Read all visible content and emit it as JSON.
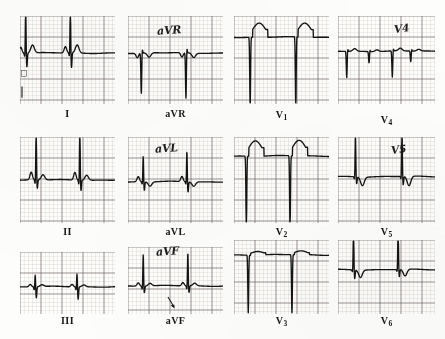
{
  "document": {
    "kind": "12-lead electrocardiogram strip montage",
    "background_color": "#fdfdfb",
    "grid_fine_color": "#b9b0ae",
    "grid_major_color": "#6d6361",
    "trace_color": "#141414",
    "caption_color": "#151515"
  },
  "layout": {
    "columns": 4,
    "rows": 3,
    "panel_width": 98,
    "panel_height": 88
  },
  "panels": [
    {
      "id": "lead-i",
      "caption": "I",
      "subscript": "",
      "handwritten_label": "",
      "x": 20,
      "y": 16,
      "w": 95,
      "h": 88,
      "baseline_frac": 0.42,
      "grid_minor_px": 4.2,
      "annotation_arrow": false,
      "beats": [
        {
          "t": 0.06,
          "type": "qRs",
          "q": 0.04,
          "r": 0.52,
          "s": 0.16,
          "p": 0.07,
          "tw": 0.09,
          "tneg": false
        },
        {
          "t": 0.53,
          "type": "qRs",
          "q": 0.04,
          "r": 0.55,
          "s": 0.17,
          "p": 0.07,
          "tw": 0.09,
          "tneg": false
        }
      ],
      "calibration_mark": true
    },
    {
      "id": "lead-avr",
      "caption": "aVR",
      "subscript": "",
      "handwritten_label": "aVR",
      "x": 128,
      "y": 16,
      "w": 95,
      "h": 88,
      "baseline_frac": 0.42,
      "grid_minor_px": 4.2,
      "annotation_arrow": false,
      "beats": [
        {
          "t": 0.15,
          "type": "QS",
          "q": 0.46,
          "r": 0.05,
          "s": 0.0,
          "p": -0.05,
          "tw": 0.05,
          "tneg": true
        },
        {
          "t": 0.62,
          "type": "QS",
          "q": 0.52,
          "r": 0.06,
          "s": 0.0,
          "p": -0.05,
          "tw": 0.05,
          "tneg": true
        }
      ],
      "calibration_mark": false
    },
    {
      "id": "lead-v1",
      "caption": "V",
      "subscript": "1",
      "handwritten_label": "",
      "x": 234,
      "y": 16,
      "w": 95,
      "h": 88,
      "baseline_frac": 0.24,
      "grid_minor_px": 4.2,
      "annotation_arrow": false,
      "beats": [
        {
          "t": 0.18,
          "type": "QS-deep-ST",
          "q": 0.8,
          "r": 0.0,
          "s": 0.0,
          "st_elev": 0.16,
          "tw": 0.0,
          "tneg": false
        },
        {
          "t": 0.66,
          "type": "QS-deep-ST",
          "q": 0.8,
          "r": 0.0,
          "s": 0.0,
          "st_elev": 0.16,
          "tw": 0.0,
          "tneg": false
        }
      ],
      "calibration_mark": false
    },
    {
      "id": "lead-v4",
      "caption": "V",
      "subscript": "4",
      "handwritten_label": "V4",
      "x": 338,
      "y": 16,
      "w": 97,
      "h": 88,
      "baseline_frac": 0.4,
      "grid_minor_px": 4.2,
      "annotation_arrow": false,
      "beats": [
        {
          "t": 0.1,
          "type": "QS-small",
          "q": 0.3,
          "r": 0.03,
          "s": 0.0,
          "tw": 0.03,
          "tneg": false
        },
        {
          "t": 0.33,
          "type": "q-notch",
          "q": 0.13,
          "r": 0.02,
          "s": 0.0,
          "tw": 0.02,
          "tneg": false
        },
        {
          "t": 0.57,
          "type": "QS-small",
          "q": 0.3,
          "r": 0.03,
          "s": 0.0,
          "tw": 0.03,
          "tneg": false
        },
        {
          "t": 0.76,
          "type": "q-notch",
          "q": 0.12,
          "r": 0.02,
          "s": 0.0,
          "tw": 0.02,
          "tneg": false
        }
      ],
      "calibration_mark": false
    },
    {
      "id": "lead-ii",
      "caption": "II",
      "subscript": "",
      "handwritten_label": "",
      "x": 20,
      "y": 137,
      "w": 95,
      "h": 86,
      "baseline_frac": 0.5,
      "grid_minor_px": 4.2,
      "annotation_arrow": false,
      "beats": [
        {
          "t": 0.17,
          "type": "qRs",
          "q": 0.05,
          "r": 0.62,
          "s": 0.1,
          "p": 0.09,
          "tw": 0.06,
          "tneg": false
        },
        {
          "t": 0.63,
          "type": "qRs",
          "q": 0.05,
          "r": 0.62,
          "s": 0.12,
          "p": 0.09,
          "tw": 0.06,
          "tneg": false
        }
      ],
      "calibration_mark": false
    },
    {
      "id": "lead-avl",
      "caption": "aVL",
      "subscript": "",
      "handwritten_label": "aVL",
      "x": 128,
      "y": 137,
      "w": 95,
      "h": 86,
      "baseline_frac": 0.52,
      "grid_minor_px": 4.2,
      "annotation_arrow": false,
      "beats": [
        {
          "t": 0.16,
          "type": "rS",
          "q": 0.03,
          "r": 0.3,
          "s": 0.1,
          "p": 0.06,
          "tw": 0.05,
          "tneg": true
        },
        {
          "t": 0.62,
          "type": "rS",
          "q": 0.03,
          "r": 0.36,
          "s": 0.12,
          "p": 0.06,
          "tw": 0.05,
          "tneg": true
        }
      ],
      "calibration_mark": false
    },
    {
      "id": "lead-v2",
      "caption": "V",
      "subscript": "2",
      "handwritten_label": "",
      "x": 234,
      "y": 137,
      "w": 95,
      "h": 86,
      "baseline_frac": 0.22,
      "grid_minor_px": 4.2,
      "annotation_arrow": false,
      "beats": [
        {
          "t": 0.14,
          "type": "QS-deep-ST",
          "q": 0.86,
          "r": 0.0,
          "s": 0.0,
          "st_elev": 0.18,
          "tw": 0.0,
          "tneg": false
        },
        {
          "t": 0.6,
          "type": "QS-deep-ST",
          "q": 0.86,
          "r": 0.0,
          "s": 0.0,
          "st_elev": 0.18,
          "tw": 0.0,
          "tneg": false
        }
      ],
      "calibration_mark": false
    },
    {
      "id": "lead-v5",
      "caption": "V",
      "subscript": "5",
      "handwritten_label": "V5",
      "x": 338,
      "y": 137,
      "w": 97,
      "h": 86,
      "baseline_frac": 0.46,
      "grid_minor_px": 4.2,
      "annotation_arrow": false,
      "beats": [
        {
          "t": 0.18,
          "type": "Rs-Tneg",
          "q": 0.03,
          "r": 0.5,
          "s": 0.08,
          "tw": 0.1,
          "tneg": true
        },
        {
          "t": 0.66,
          "type": "Rs-Tneg",
          "q": 0.03,
          "r": 0.52,
          "s": 0.1,
          "tw": 0.11,
          "tneg": true
        }
      ],
      "calibration_mark": false
    },
    {
      "id": "lead-iii",
      "caption": "III",
      "subscript": "",
      "handwritten_label": "",
      "x": 20,
      "y": 252,
      "w": 95,
      "h": 62,
      "baseline_frac": 0.56,
      "grid_minor_px": 4.2,
      "annotation_arrow": false,
      "beats": [
        {
          "t": 0.16,
          "type": "rs-small",
          "q": 0.05,
          "r": 0.2,
          "s": 0.18,
          "p": 0.04,
          "tw": 0.03,
          "tneg": false
        },
        {
          "t": 0.6,
          "type": "rs-small",
          "q": 0.05,
          "r": 0.22,
          "s": 0.2,
          "p": 0.04,
          "tw": 0.03,
          "tneg": false
        }
      ],
      "calibration_mark": false
    },
    {
      "id": "lead-avf",
      "caption": "aVF",
      "subscript": "",
      "handwritten_label": "aVF",
      "x": 128,
      "y": 247,
      "w": 95,
      "h": 67,
      "baseline_frac": 0.58,
      "grid_minor_px": 4.2,
      "annotation_arrow": true,
      "arrow_x_frac": 0.49,
      "beats": [
        {
          "t": 0.16,
          "type": "qRs",
          "q": 0.05,
          "r": 0.48,
          "s": 0.1,
          "p": 0.05,
          "tw": 0.04,
          "tneg": false
        },
        {
          "t": 0.63,
          "type": "qRs",
          "q": 0.05,
          "r": 0.5,
          "s": 0.1,
          "p": 0.05,
          "tw": 0.04,
          "tneg": false
        }
      ],
      "calibration_mark": false
    },
    {
      "id": "lead-v3",
      "caption": "V",
      "subscript": "3",
      "handwritten_label": "",
      "x": 234,
      "y": 240,
      "w": 95,
      "h": 74,
      "baseline_frac": 0.2,
      "grid_minor_px": 4.2,
      "annotation_arrow": false,
      "beats": [
        {
          "t": 0.16,
          "type": "QS-deep",
          "q": 0.78,
          "r": 0.0,
          "s": 0.0,
          "st_elev": 0.05,
          "tw": 0.0,
          "tneg": false
        },
        {
          "t": 0.62,
          "type": "QS-deep",
          "q": 0.8,
          "r": 0.0,
          "s": 0.0,
          "st_elev": 0.05,
          "tw": 0.0,
          "tneg": false
        }
      ],
      "calibration_mark": false
    },
    {
      "id": "lead-v6",
      "caption": "V",
      "subscript": "6",
      "handwritten_label": "",
      "x": 338,
      "y": 240,
      "w": 97,
      "h": 74,
      "baseline_frac": 0.4,
      "grid_minor_px": 4.2,
      "annotation_arrow": false,
      "beats": [
        {
          "t": 0.16,
          "type": "RS-Tneg",
          "q": 0.03,
          "r": 0.58,
          "s": 0.12,
          "tw": 0.1,
          "tneg": true
        },
        {
          "t": 0.62,
          "type": "RS-Tneg",
          "q": 0.03,
          "r": 0.6,
          "s": 0.1,
          "tw": 0.09,
          "tneg": true
        }
      ],
      "calibration_mark": false
    }
  ],
  "captions": {
    "lead_i": "I",
    "lead_avr": "aVR",
    "lead_v1_main": "V",
    "lead_v1_sub": "1",
    "lead_v4_main": "V",
    "lead_v4_sub": "4",
    "lead_ii": "II",
    "lead_avl": "aVL",
    "lead_v2_main": "V",
    "lead_v2_sub": "2",
    "lead_v5_main": "V",
    "lead_v5_sub": "5",
    "lead_iii": "III",
    "lead_avf": "aVF",
    "lead_v3_main": "V",
    "lead_v3_sub": "3",
    "lead_v6_main": "V",
    "lead_v6_sub": "6"
  },
  "handwritten": {
    "avr": "aVR",
    "avl": "aVL",
    "avf": "aVF",
    "v4": "V4",
    "v5": "V5"
  }
}
